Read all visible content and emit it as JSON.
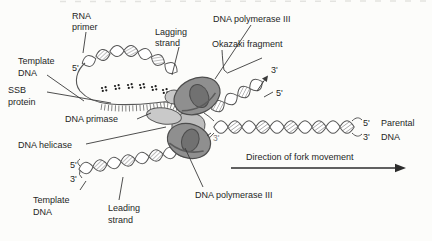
{
  "figure": {
    "title_semantic": "DNA replication fork diagram",
    "labels": {
      "rna_primer_1": "RNA",
      "rna_primer_2": "primer",
      "lagging_1": "Lagging",
      "lagging_2": "strand",
      "dna_pol_top": "DNA polymerase III",
      "okazaki": "Okazaki fragment",
      "template_top_1": "Template",
      "template_top_2": "DNA",
      "five_top": "5'",
      "ssb_1": "SSB",
      "ssb_2": "protein",
      "dna_primase": "DNA primase",
      "dna_helicase": "DNA helicase",
      "three_inner": "3'",
      "five_left": "5'",
      "three_left": "3'",
      "template_bottom_1": "Template",
      "template_bottom_2": "DNA",
      "leading_1": "Leading",
      "leading_2": "strand",
      "dna_pol_bottom": "DNA polymerase III",
      "three_right": "3'",
      "five_right": "5'",
      "parental_five": "5'",
      "parental_word": "Parental",
      "parental_three": "3'",
      "parental_dna": "DNA",
      "direction": "Direction of fork movement"
    },
    "colors": {
      "background": "#fcfcfa",
      "polymerase_body": "#8f8f8f",
      "polymerase_hole": "#717171",
      "light_protein": "#c7c7c7",
      "outline": "#4d4d4d",
      "strand_line": "#565656",
      "text": "#1f1f1f",
      "gray_text": "#7d7d7d"
    }
  }
}
